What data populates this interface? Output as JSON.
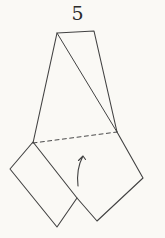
{
  "figure": {
    "step_label": "5",
    "colors": {
      "background": "#faf9f5",
      "line": "#424242",
      "dashed_line": "#4a4a4a",
      "label_text": "#2b2b2b"
    },
    "shapes": [
      {
        "name": "upper-shape-outline",
        "type": "polyline",
        "points": [
          [
            33,
            143
          ],
          [
            57,
            33
          ],
          [
            94,
            31
          ],
          [
            117,
            132
          ]
        ],
        "width": 1.1
      },
      {
        "name": "upper-shape-fold-diagonal",
        "type": "polyline",
        "points": [
          [
            57,
            33
          ],
          [
            117,
            132
          ]
        ],
        "width": 1.0
      },
      {
        "name": "valley-fold-dashed-line",
        "type": "polyline",
        "points": [
          [
            33,
            143
          ],
          [
            117,
            132
          ]
        ],
        "width": 1.0,
        "dash": "4 3.4"
      },
      {
        "name": "right-flap-outline",
        "type": "polyline",
        "points": [
          [
            117,
            132
          ],
          [
            143,
            178
          ],
          [
            97,
            221
          ],
          [
            77,
            198
          ]
        ],
        "width": 1.1
      },
      {
        "name": "left-flap-outline",
        "type": "polygon",
        "points": [
          [
            33,
            142
          ],
          [
            77,
            198
          ],
          [
            57,
            227
          ],
          [
            10,
            169
          ]
        ],
        "width": 1.1
      },
      {
        "name": "fold-direction-arrow",
        "type": "path",
        "d": "M 78,186 Q 76,169 83,156 M 83,156 L 78.5,160.5 M 83,156 L 85.5,159.5",
        "width": 1.1
      }
    ]
  }
}
